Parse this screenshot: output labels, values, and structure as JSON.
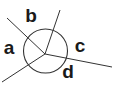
{
  "diagram": {
    "type": "angles-around-a-point",
    "stroke_color": "#333333",
    "background": "#ffffff",
    "vertex": {
      "x": 45,
      "y": 54
    },
    "circle": {
      "cx": 45.5,
      "cy": 51,
      "r": 22
    },
    "rays": [
      {
        "name": "upper-left",
        "x2": 7,
        "y2": 18
      },
      {
        "name": "upper",
        "x2": 60,
        "y2": 10
      },
      {
        "name": "right",
        "x2": 112,
        "y2": 67
      },
      {
        "name": "lower-left",
        "x2": 2,
        "y2": 82
      }
    ],
    "labels": [
      {
        "id": "a",
        "text": "a",
        "x": 9,
        "y": 47
      },
      {
        "id": "b",
        "text": "b",
        "x": 31,
        "y": 15
      },
      {
        "id": "c",
        "text": "c",
        "x": 80,
        "y": 45
      },
      {
        "id": "d",
        "text": "d",
        "x": 68,
        "y": 71
      }
    ]
  }
}
